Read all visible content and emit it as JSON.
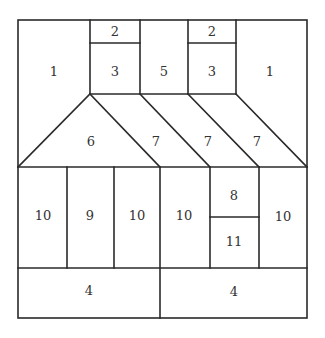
{
  "diagram": {
    "type": "quilt-block-piecing-layout",
    "line_color": "#2a2a2a",
    "text_color": "#333333",
    "background": "#ffffff",
    "pieces": [
      {
        "id": "piece-1-left",
        "label": "1",
        "x": 54,
        "y": 72
      },
      {
        "id": "piece-2-left",
        "label": "2",
        "x": 115,
        "y": 32
      },
      {
        "id": "piece-3-left",
        "label": "3",
        "x": 115,
        "y": 72
      },
      {
        "id": "piece-5",
        "label": "5",
        "x": 164,
        "y": 72
      },
      {
        "id": "piece-2-right",
        "label": "2",
        "x": 212,
        "y": 32
      },
      {
        "id": "piece-3-right",
        "label": "3",
        "x": 212,
        "y": 72
      },
      {
        "id": "piece-1-right",
        "label": "1",
        "x": 270,
        "y": 72
      },
      {
        "id": "piece-6",
        "label": "6",
        "x": 91,
        "y": 142
      },
      {
        "id": "piece-7-a",
        "label": "7",
        "x": 156,
        "y": 142
      },
      {
        "id": "piece-7-b",
        "label": "7",
        "x": 208,
        "y": 142
      },
      {
        "id": "piece-7-c",
        "label": "7",
        "x": 257,
        "y": 142
      },
      {
        "id": "piece-10-a",
        "label": "10",
        "x": 43,
        "y": 216
      },
      {
        "id": "piece-9",
        "label": "9",
        "x": 90,
        "y": 216
      },
      {
        "id": "piece-10-b",
        "label": "10",
        "x": 137,
        "y": 216
      },
      {
        "id": "piece-10-c",
        "label": "10",
        "x": 184,
        "y": 216
      },
      {
        "id": "piece-8",
        "label": "8",
        "x": 234,
        "y": 196
      },
      {
        "id": "piece-11",
        "label": "11",
        "x": 234,
        "y": 242
      },
      {
        "id": "piece-10-d",
        "label": "10",
        "x": 283,
        "y": 217
      },
      {
        "id": "piece-4-left",
        "label": "4",
        "x": 89,
        "y": 291
      },
      {
        "id": "piece-4-right",
        "label": "4",
        "x": 234,
        "y": 292
      }
    ]
  }
}
